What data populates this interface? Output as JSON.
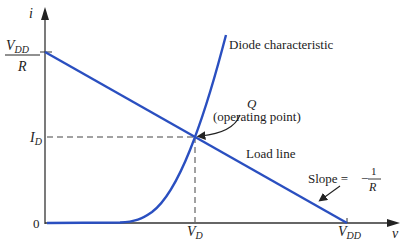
{
  "diagram": {
    "axes": {
      "x_label": "v",
      "y_label": "i"
    },
    "y_ticks": {
      "top_numerator": "V",
      "top_numerator_sub": "DD",
      "top_denominator": "R",
      "operating_current": "I",
      "operating_current_sub": "D",
      "origin": "0"
    },
    "x_ticks": {
      "operating_voltage": "V",
      "operating_voltage_sub": "D",
      "supply": "V",
      "supply_sub": "DD"
    },
    "curves": {
      "diode": "Diode characteristic",
      "load": "Load line"
    },
    "annotations": {
      "q_symbol": "Q",
      "q_desc": "(operating point)",
      "slope_text": "Slope =",
      "slope_minus": "−",
      "slope_num": "1",
      "slope_den": "R"
    },
    "colors": {
      "curve": "#2a4fc0",
      "axis": "#333333",
      "guide": "#444444"
    }
  }
}
